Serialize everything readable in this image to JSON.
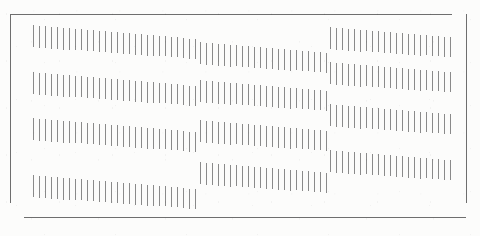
{
  "figure": {
    "kind": "zollner-illusion-plate",
    "background_color": "#fcfcfb",
    "tick_color": "#8a8a8a",
    "frame_color": "#6e6e6e"
  },
  "frame": {
    "left": 10,
    "top": 14,
    "right": 466,
    "bottom": 217,
    "corner_gap": 14,
    "stroke_width": 1
  },
  "layout": {
    "columns": 3,
    "rows": 4,
    "column_x": [
      33,
      200,
      330
    ],
    "row_y": [
      25,
      72,
      118,
      175
    ],
    "tick_pitch": 6.0,
    "tick_width": 1
  },
  "chart_data": {
    "type": "scatter",
    "title": "",
    "xlabel": "",
    "ylabel": "",
    "grid": false,
    "legend": null,
    "bands": [
      {
        "id": "r1c1",
        "row": 1,
        "col": 1,
        "x0": 33,
        "y0": 25,
        "count": 28,
        "pitch": 6.0,
        "len0": 22,
        "len1": 20,
        "slope": 0.52,
        "skew": 0.0
      },
      {
        "id": "r1c2",
        "row": 1,
        "col": 2,
        "x0": 200,
        "y0": 42,
        "count": 22,
        "pitch": 6.0,
        "len0": 22,
        "len1": 20,
        "slope": 0.52,
        "skew": 0.0
      },
      {
        "id": "r1c3",
        "row": 1,
        "col": 3,
        "x0": 330,
        "y0": 27,
        "count": 21,
        "pitch": 6.0,
        "len0": 22,
        "len1": 20,
        "slope": 0.52,
        "skew": 0.0
      },
      {
        "id": "r2c1",
        "row": 2,
        "col": 1,
        "x0": 33,
        "y0": 72,
        "count": 28,
        "pitch": 6.0,
        "len0": 22,
        "len1": 20,
        "slope": 0.52,
        "skew": 0.0
      },
      {
        "id": "r2c2",
        "row": 2,
        "col": 2,
        "x0": 200,
        "y0": 80,
        "count": 22,
        "pitch": 6.0,
        "len0": 22,
        "len1": 20,
        "slope": 0.52,
        "skew": 0.0
      },
      {
        "id": "r2c3",
        "row": 2,
        "col": 3,
        "x0": 330,
        "y0": 62,
        "count": 21,
        "pitch": 6.0,
        "len0": 22,
        "len1": 20,
        "slope": 0.52,
        "skew": 0.0
      },
      {
        "id": "r3c1",
        "row": 3,
        "col": 1,
        "x0": 33,
        "y0": 118,
        "count": 28,
        "pitch": 6.0,
        "len0": 22,
        "len1": 20,
        "slope": 0.52,
        "skew": 0.0
      },
      {
        "id": "r3c2",
        "row": 3,
        "col": 2,
        "x0": 200,
        "y0": 120,
        "count": 22,
        "pitch": 6.0,
        "len0": 22,
        "len1": 20,
        "slope": 0.52,
        "skew": 0.0
      },
      {
        "id": "r3c3",
        "row": 3,
        "col": 3,
        "x0": 330,
        "y0": 104,
        "count": 21,
        "pitch": 6.0,
        "len0": 22,
        "len1": 20,
        "slope": 0.52,
        "skew": 0.0
      },
      {
        "id": "r4c1",
        "row": 4,
        "col": 1,
        "x0": 33,
        "y0": 175,
        "count": 28,
        "pitch": 6.0,
        "len0": 22,
        "len1": 20,
        "slope": 0.52,
        "skew": 0.0
      },
      {
        "id": "r4c2",
        "row": 4,
        "col": 2,
        "x0": 200,
        "y0": 162,
        "count": 22,
        "pitch": 6.0,
        "len0": 22,
        "len1": 20,
        "slope": 0.52,
        "skew": 0.0
      },
      {
        "id": "r4c3",
        "row": 4,
        "col": 3,
        "x0": 330,
        "y0": 150,
        "count": 21,
        "pitch": 6.0,
        "len0": 22,
        "len1": 20,
        "slope": 0.52,
        "skew": 0.0
      }
    ]
  }
}
